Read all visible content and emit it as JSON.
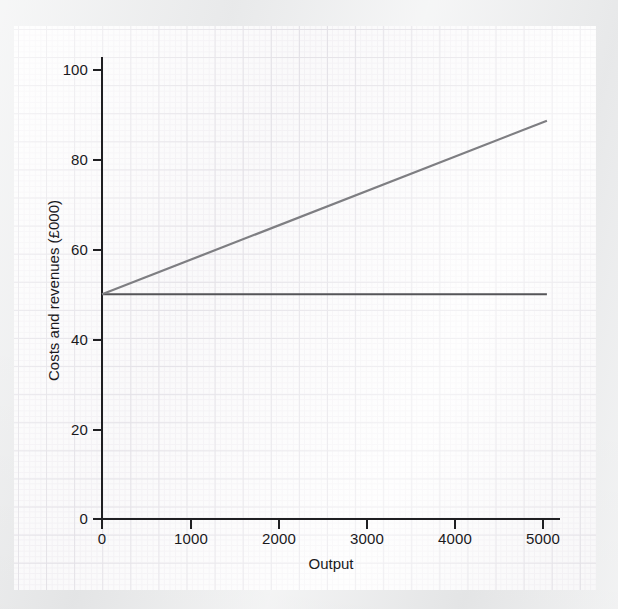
{
  "figure": {
    "background_color": "#ecedee",
    "paper_color": "#fdfdfd",
    "grid_major_color": "#dedce2",
    "grid_minor_color": "#f3f1f4",
    "axis_color": "#1f1f22"
  },
  "chart_data": {
    "type": "line",
    "title": "",
    "subtitle": "",
    "xlabel": "Output",
    "ylabel": "Costs and revenues (£000)",
    "xlim": [
      0,
      5200
    ],
    "ylim": [
      0,
      104
    ],
    "xticks": [
      0,
      1000,
      2000,
      3000,
      4000,
      5000
    ],
    "xtick_labels": [
      "0",
      "1000",
      "2000",
      "3000",
      "4000",
      "5000"
    ],
    "yticks": [
      0,
      20,
      40,
      60,
      80,
      100
    ],
    "ytick_labels": [
      "0",
      "20",
      "40",
      "60",
      "80",
      "100"
    ],
    "grid": true,
    "grid_style": "graph-paper",
    "legend": false,
    "legend_position": "none",
    "annotations": [],
    "series": [
      {
        "name": "fixed-cost-line",
        "color": "#555558",
        "width": 2.2,
        "x": [
          0,
          5050
        ],
        "y": [
          50,
          50
        ],
        "values": [
          50,
          50
        ]
      },
      {
        "name": "revenue-line",
        "color": "#7e7e82",
        "width": 2.2,
        "x": [
          0,
          5050
        ],
        "y": [
          50,
          88.6
        ],
        "values": [
          50,
          88.6
        ]
      }
    ]
  }
}
